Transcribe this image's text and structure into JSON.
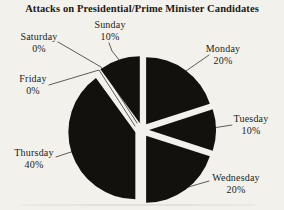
{
  "title": "Attacks on Presidential/Prime Minister Candidates",
  "chart_data": {
    "type": "pie",
    "title": "Attacks on Presidential/Prime Minister Candidates",
    "unit": "percent",
    "start_angle_deg_from_top": 0,
    "direction": "clockwise",
    "style": "exploded, solid black slices, white gaps, thin leader lines to labels",
    "slices": [
      {
        "label": "Monday",
        "value": 20,
        "pct_label": "20%"
      },
      {
        "label": "Tuesday",
        "value": 10,
        "pct_label": "10%"
      },
      {
        "label": "Wednesday",
        "value": 20,
        "pct_label": "20%"
      },
      {
        "label": "Thursday",
        "value": 40,
        "pct_label": "40%"
      },
      {
        "label": "Friday",
        "value": 0,
        "pct_label": "0%"
      },
      {
        "label": "Saturday",
        "value": 0,
        "pct_label": "0%"
      },
      {
        "label": "Sunday",
        "value": 10,
        "pct_label": "10%"
      }
    ],
    "colors": {
      "slice_fill": "#12110d",
      "background": "#f2f1ec",
      "leader_line": "#4c4b46",
      "text": "#201e18"
    },
    "legend": "none (labels with percentages placed around pie, connected by leader lines)"
  }
}
